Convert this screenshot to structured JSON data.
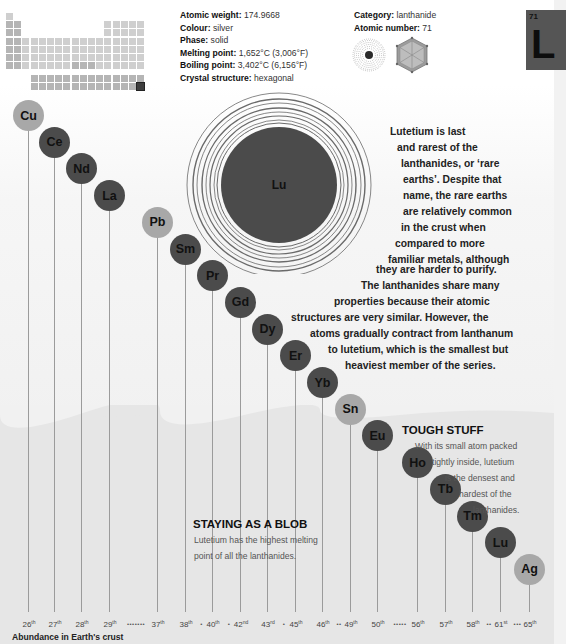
{
  "element": {
    "symbol": "Lu",
    "tile_symbol": "L",
    "atomic_number": "71",
    "atomic_weight": "174.9668",
    "colour": "silver",
    "phase": "solid",
    "melting_point": "1,652°C (3,006°F)",
    "boiling_point": "3,402°C (6,156°F)",
    "crystal_structure": "hexagonal",
    "category": "lanthanide"
  },
  "fact_labels": {
    "atomic_weight": "Atomic weight:",
    "colour": "Colour:",
    "phase": "Phase:",
    "melting_point": "Melting point:",
    "boiling_point": "Boiling point:",
    "crystal_structure": "Crystal structure:",
    "category": "Category:",
    "atomic_number": "Atomic number:"
  },
  "icons": {
    "periodic_table": "periodic-table-locator",
    "electron_shells": "electron-shell-diagram",
    "crystal": "hexagonal-crystal-icon"
  },
  "intro_lines": [
    "Lutetium is last",
    "and rarest of the",
    "lanthanides, or ‘rare",
    "earths’. Despite that",
    "name, the rare earths",
    "are relatively common",
    "in the crust when",
    "compared to more",
    "familiar metals, although",
    "they are harder to purify.",
    "The lanthanides share many",
    "properties because their atomic",
    "structures are very similar. However, the",
    "atoms gradually contract from lanthanum",
    "to lutetium, which is the smallest but",
    "heaviest member of the series."
  ],
  "stories": {
    "tough": {
      "heading": "TOUGH STUFF",
      "lines": [
        "With its small atom packed",
        "tightly inside, lutetium",
        "is the densest and",
        "hardest of the",
        "lanthanides."
      ]
    },
    "blob": {
      "heading": "STAYING AS A BLOB",
      "lines": [
        "Lutetium has the highest melting",
        "point of all the lanthanides."
      ]
    }
  },
  "chart_data": {
    "type": "bar",
    "title": "Abundance in Earth's crust",
    "xlabel": "Abundance in Earth's crust",
    "categories": [
      "Cu",
      "Ce",
      "Nd",
      "La",
      "Pb",
      "Sm",
      "Pr",
      "Gd",
      "Dy",
      "Er",
      "Yb",
      "Sn",
      "Eu",
      "Ho",
      "Tb",
      "Tm",
      "Lu",
      "Ag"
    ],
    "rank_values": [
      26,
      27,
      28,
      29,
      37,
      38,
      40,
      42,
      43,
      45,
      46,
      49,
      50,
      56,
      57,
      58,
      61,
      65
    ],
    "rank_labels": [
      "26th",
      "27th",
      "28th",
      "29th",
      "37th",
      "38th",
      "40th",
      "42nd",
      "43rd",
      "45th",
      "46th",
      "49th",
      "50th",
      "56th",
      "57th",
      "58th",
      "61st",
      "65th"
    ],
    "highlight": {
      "Cu": "light",
      "Ce": "dark",
      "Nd": "dark",
      "La": "dark",
      "Pb": "light",
      "Sm": "dark",
      "Pr": "dark",
      "Gd": "dark",
      "Dy": "dark",
      "Er": "dark",
      "Yb": "dark",
      "Sn": "light",
      "Eu": "dark",
      "Ho": "dark",
      "Tb": "dark",
      "Tm": "dark",
      "Lu": "dark",
      "Ag": "light"
    },
    "gap_markers": [
      {
        "after": "29th",
        "dots": "•••••••"
      },
      {
        "after": "38th",
        "dots": "•"
      },
      {
        "after": "40th",
        "dots": "•"
      },
      {
        "after": "43rd",
        "dots": "•"
      },
      {
        "after": "46th",
        "dots": "••"
      },
      {
        "after": "50th",
        "dots": "•••••"
      },
      {
        "after": "58th",
        "dots": "••"
      },
      {
        "after": "61st",
        "dots": "•••"
      }
    ]
  },
  "colors": {
    "lanthanide_bubble": "#4b4b4b",
    "other_metal_bubble": "#a8a8a8",
    "atom_core": "#4b4b4b",
    "background": "#f2f2f2"
  }
}
